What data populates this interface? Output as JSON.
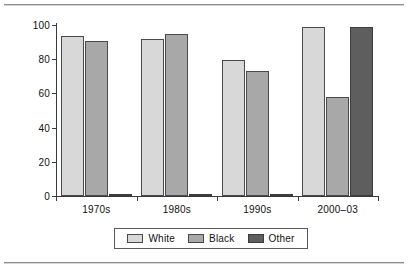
{
  "chart_data": {
    "type": "bar",
    "title": "",
    "subtitle": "",
    "xlabel": "",
    "ylabel": "",
    "categories": [
      "1970s",
      "1980s",
      "1990s",
      "2000–03"
    ],
    "series": [
      {
        "name": "White",
        "color": "#d8d8d8",
        "values": [
          93.5,
          92.0,
          79.5,
          99.0
        ]
      },
      {
        "name": "Black",
        "color": "#a8a8a8",
        "values": [
          90.5,
          95.0,
          73.0,
          58.0
        ]
      },
      {
        "name": "Other",
        "color": "#5e5e5e",
        "values": [
          0.5,
          0.6,
          0.5,
          99.0
        ]
      }
    ],
    "ylim": [
      0,
      100
    ],
    "yticks": [
      0,
      20,
      40,
      60,
      80,
      100
    ],
    "ytick_labels": [
      "0",
      "20",
      "40",
      "60",
      "80",
      "100"
    ],
    "grid": false,
    "legend_position": "bottom",
    "legend_entries": [
      "White",
      "Black",
      "Other"
    ],
    "annotations": []
  },
  "legend": {
    "items": [
      {
        "label": "White",
        "color": "#d8d8d8"
      },
      {
        "label": "Black",
        "color": "#a8a8a8"
      },
      {
        "label": "Other",
        "color": "#5e5e5e"
      }
    ]
  },
  "axes": {
    "y_tick_labels": [
      "100",
      "80",
      "60",
      "40",
      "20",
      "0"
    ],
    "x_tick_labels": [
      "1970s",
      "1980s",
      "1990s",
      "2000–03"
    ]
  }
}
